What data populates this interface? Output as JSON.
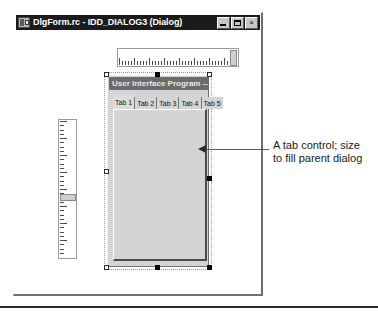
{
  "window": {
    "title": "DlgForm.rc - IDD_DIALOG3 (Dialog)",
    "icon": "resource-script-icon",
    "buttons": {
      "minimize": "Minimize",
      "maximize": "Maximize",
      "close": "×"
    }
  },
  "rulers": {
    "horizontal": {
      "name": "horizontal-ruler",
      "tick_count": 41,
      "major_every": 5
    },
    "vertical": {
      "name": "vertical-ruler",
      "tick_count": 33,
      "major_every": 4
    }
  },
  "dialog": {
    "caption": "User Interface Program -- Setup",
    "resource_id": "IDD_DIALOG3"
  },
  "tab_control": {
    "name": "tab-control",
    "selected_index": 0,
    "tabs": [
      {
        "label": "Tab 1"
      },
      {
        "label": "Tab 2"
      },
      {
        "label": "Tab 3"
      },
      {
        "label": "Tab 4"
      },
      {
        "label": "Tab 5"
      }
    ]
  },
  "selection_handles": [
    {
      "id": "top-left",
      "style": "hollow",
      "x": 0,
      "y": 0
    },
    {
      "id": "top-center",
      "style": "solid",
      "x": 51,
      "y": 0
    },
    {
      "id": "top-right",
      "style": "hollow",
      "x": 103,
      "y": 0
    },
    {
      "id": "middle-left",
      "style": "hollow",
      "x": 0,
      "y": 97
    },
    {
      "id": "middle-right",
      "style": "solid",
      "x": 103,
      "y": 104
    },
    {
      "id": "bottom-left",
      "style": "hollow",
      "x": 0,
      "y": 193
    },
    {
      "id": "bottom-center",
      "style": "solid",
      "x": 51,
      "y": 193
    },
    {
      "id": "bottom-right",
      "style": "solid",
      "x": 103,
      "y": 193
    }
  ],
  "callout": {
    "line1": "A tab control; size",
    "line2": "to fill parent dialog"
  },
  "colors": {
    "titlebar_bg": "#1b1b1b",
    "dialog_caption_bg": "#6b6b6b",
    "face": "#d4d4d4",
    "text": "#1a1a1a"
  }
}
